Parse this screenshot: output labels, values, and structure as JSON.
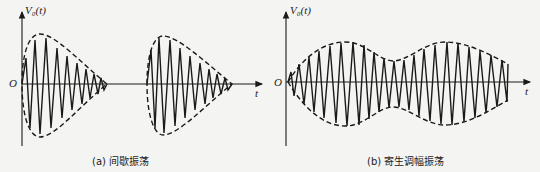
{
  "panels": [
    {
      "id": "a",
      "caption": "(a) 间歇振荡",
      "y_axis_label": "V₀(t)",
      "x_axis_label": "t",
      "origin_label": "O",
      "description": "Intermittent oscillation: two decaying sinusoidal bursts with dashed envelopes"
    },
    {
      "id": "b",
      "caption": "(b) 寄生调幅振荡",
      "y_axis_label": "V₀(t)",
      "x_axis_label": "t",
      "origin_label": "O",
      "description": "Parasitic amplitude-modulated oscillation: continuous oscillation with slowly varying dashed envelope"
    }
  ],
  "colors": {
    "background": "#f4f4f2",
    "stroke": "#1a1a1a"
  }
}
